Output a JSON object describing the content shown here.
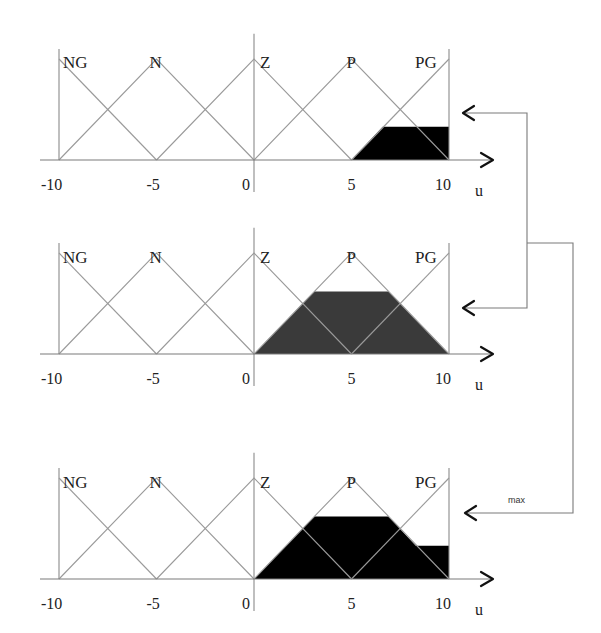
{
  "figure": {
    "membership_labels": [
      "NG",
      "N",
      "Z",
      "P",
      "PG"
    ],
    "tick_labels": [
      "-10",
      "-5",
      "0",
      "5",
      "10"
    ],
    "axis_label": "u",
    "aggregation_label": "max",
    "colors": {
      "membership_line": "#9a9a9a",
      "fill_top": "#000000",
      "fill_middle": "#3a3a3a",
      "fill_bottom": "#000000"
    }
  },
  "chart_data": [
    {
      "type": "area",
      "title": "Clipped output set PG",
      "xlabel": "u",
      "xlim": [
        -10,
        10
      ],
      "ylim": [
        0,
        1
      ],
      "sets": {
        "NG": [
          -10,
          -10,
          -5
        ],
        "N": [
          -10,
          -5,
          0
        ],
        "Z": [
          -5,
          0,
          5
        ],
        "P": [
          0,
          5,
          10
        ],
        "PG": [
          5,
          10,
          10
        ]
      },
      "clip_set": "PG",
      "clip_level": 0.33,
      "filled_polygon": [
        [
          5,
          0
        ],
        [
          6.6,
          0.33
        ],
        [
          10,
          0.33
        ],
        [
          10,
          0
        ]
      ]
    },
    {
      "type": "area",
      "title": "Clipped output set P",
      "xlabel": "u",
      "xlim": [
        -10,
        10
      ],
      "ylim": [
        0,
        1
      ],
      "sets": {
        "NG": [
          -10,
          -10,
          -5
        ],
        "N": [
          -10,
          -5,
          0
        ],
        "Z": [
          -5,
          0,
          5
        ],
        "P": [
          0,
          5,
          10
        ],
        "PG": [
          5,
          10,
          10
        ]
      },
      "clip_set": "P",
      "clip_level": 0.62,
      "filled_polygon": [
        [
          0,
          0
        ],
        [
          3.1,
          0.62
        ],
        [
          6.9,
          0.62
        ],
        [
          10,
          0
        ]
      ]
    },
    {
      "type": "area",
      "title": "Aggregated output (max)",
      "xlabel": "u",
      "xlim": [
        -10,
        10
      ],
      "ylim": [
        0,
        1
      ],
      "sets": {
        "NG": [
          -10,
          -10,
          -5
        ],
        "N": [
          -10,
          -5,
          0
        ],
        "Z": [
          -5,
          0,
          5
        ],
        "P": [
          0,
          5,
          10
        ],
        "PG": [
          5,
          10,
          10
        ]
      },
      "aggregation": "max",
      "filled_polygon": [
        [
          0,
          0
        ],
        [
          3.1,
          0.62
        ],
        [
          6.9,
          0.62
        ],
        [
          8.3,
          0.33
        ],
        [
          10,
          0.33
        ],
        [
          10,
          0
        ]
      ]
    }
  ],
  "panels": [
    {
      "origin_y": 160,
      "label_y": 52,
      "tick_y": 184,
      "fill_class": "fill_top"
    },
    {
      "origin_y": 354,
      "label_y": 247,
      "tick_y": 378,
      "fill_class": "fill_middle"
    },
    {
      "origin_y": 579,
      "label_y": 472,
      "tick_y": 603,
      "fill_class": "fill_bottom"
    }
  ]
}
